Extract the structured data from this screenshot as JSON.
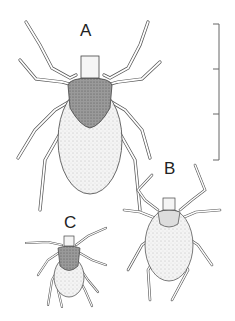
{
  "figure": {
    "labels": {
      "a": "A",
      "b": "B",
      "c": "C"
    },
    "specimens": [
      {
        "label": "A",
        "description": "largest tick, adult female with engorged body"
      },
      {
        "label": "B",
        "description": "medium tick"
      },
      {
        "label": "C",
        "description": "smallest tick"
      }
    ],
    "scale_bar": {
      "segments": 3,
      "orientation": "vertical"
    }
  }
}
